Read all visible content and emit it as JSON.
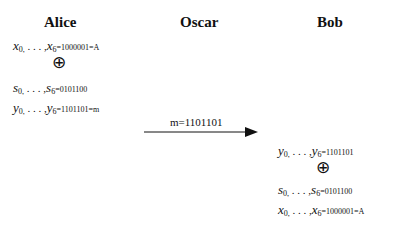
{
  "parties": {
    "alice": "Alice",
    "oscar": "Oscar",
    "bob": "Bob"
  },
  "alice": {
    "line_x": {
      "var": "x",
      "first_sub": "0,",
      "dots": " . . . ,",
      "last_sub": "6",
      "value": "=1000001=A"
    },
    "xor_symbol": "⊕",
    "line_s": {
      "var": "s",
      "first_sub": "0,",
      "dots": " . . . ,",
      "last_sub": "6",
      "value": "=0101100"
    },
    "line_y": {
      "var": "y",
      "first_sub": "0,",
      "dots": " . . . ,",
      "last_sub": "6",
      "value": "=1101101=m"
    }
  },
  "channel": {
    "label": "m=1101101"
  },
  "bob": {
    "line_y": {
      "var": "y",
      "first_sub": "0,",
      "dots": " . . . ,",
      "last_sub": "6",
      "value": "=1101101"
    },
    "xor_symbol": "⊕",
    "line_s": {
      "var": "s",
      "first_sub": "0,",
      "dots": "  . . . ,",
      "last_sub": "6",
      "value": "=0101100"
    },
    "line_x": {
      "var": "x",
      "first_sub": "0,",
      "dots": " . . . ,",
      "last_sub": "6",
      "value": "=1000001=A"
    }
  }
}
